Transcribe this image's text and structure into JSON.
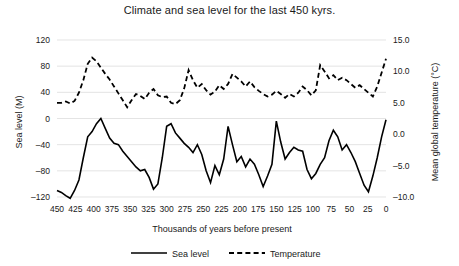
{
  "chart_data": {
    "type": "line",
    "title": "Climate and sea level for the last 450 kyrs.",
    "xlabel": "Thousands of years before present",
    "ylabel": "Sea level (M)",
    "y2label": "Mean global temperature (°C)",
    "grid": true,
    "legend_position": "bottom",
    "xlim": [
      450,
      0
    ],
    "x_inverted": true,
    "ylim": [
      -120,
      120
    ],
    "y2lim": [
      -10.0,
      15.0
    ],
    "xticks": [
      450,
      425,
      400,
      375,
      350,
      325,
      300,
      275,
      250,
      225,
      200,
      175,
      150,
      125,
      100,
      75,
      50,
      25,
      0
    ],
    "xtick_labels": [
      "450",
      "425",
      "400",
      "375",
      "350",
      "325",
      "300",
      "275",
      "250",
      "225",
      "200",
      "175",
      "150",
      "125",
      "100",
      "75",
      "50",
      "25",
      "0"
    ],
    "yticks": [
      120,
      80,
      40,
      0,
      -40,
      -80,
      -120
    ],
    "ytick_labels": [
      "120",
      "80",
      "40",
      "0",
      "–40",
      "–80",
      "–120"
    ],
    "y2ticks": [
      15.0,
      10.0,
      5.0,
      0.0,
      -5.0,
      -10.0
    ],
    "y2tick_labels": [
      "15.0",
      "10.0",
      "5.0",
      "0.0",
      "–5.0",
      "–10.0"
    ],
    "x": [
      450,
      444,
      438,
      432,
      426,
      420,
      414,
      408,
      402,
      396,
      390,
      384,
      378,
      372,
      366,
      360,
      354,
      348,
      342,
      336,
      330,
      324,
      318,
      312,
      306,
      300,
      294,
      288,
      282,
      276,
      270,
      264,
      258,
      252,
      246,
      240,
      234,
      228,
      222,
      216,
      210,
      204,
      198,
      192,
      186,
      180,
      174,
      168,
      162,
      156,
      150,
      144,
      138,
      132,
      126,
      120,
      114,
      108,
      102,
      96,
      90,
      84,
      78,
      72,
      66,
      60,
      54,
      48,
      42,
      36,
      30,
      24,
      18,
      12,
      6,
      0
    ],
    "series": [
      {
        "name": "Sea level",
        "axis": "left",
        "units": "M",
        "style": "solid",
        "color": "#000000",
        "values": [
          -110,
          -113,
          -118,
          -122,
          -110,
          -94,
          -60,
          -28,
          -20,
          -8,
          0,
          -15,
          -30,
          -38,
          -40,
          -50,
          -58,
          -66,
          -74,
          -80,
          -78,
          -90,
          -108,
          -100,
          -60,
          -12,
          -8,
          -22,
          -30,
          -38,
          -44,
          -52,
          -40,
          -55,
          -80,
          -98,
          -72,
          -86,
          -62,
          -12,
          -40,
          -66,
          -58,
          -74,
          -62,
          -70,
          -86,
          -104,
          -88,
          -70,
          -4,
          -36,
          -62,
          -52,
          -44,
          -48,
          -50,
          -78,
          -92,
          -84,
          -70,
          -60,
          -34,
          -18,
          -28,
          -48,
          -40,
          -52,
          -66,
          -84,
          -102,
          -112,
          -88,
          -60,
          -28,
          -2
        ]
      },
      {
        "name": "Temperature",
        "axis": "right",
        "units": "°C",
        "style": "dashed",
        "color": "#000000",
        "values": [
          5.0,
          5.0,
          5.2,
          4.9,
          5.3,
          6.6,
          8.6,
          11.2,
          12.2,
          11.6,
          10.6,
          9.6,
          8.7,
          7.6,
          6.5,
          5.4,
          4.3,
          5.4,
          6.4,
          6.1,
          5.6,
          6.6,
          7.2,
          6.2,
          5.9,
          6.0,
          5.0,
          4.8,
          5.4,
          7.3,
          10.2,
          8.6,
          7.4,
          8.0,
          7.0,
          6.3,
          6.8,
          7.8,
          7.2,
          8.0,
          9.6,
          9.0,
          8.4,
          7.6,
          8.4,
          7.5,
          6.9,
          6.4,
          6.0,
          6.3,
          6.9,
          6.4,
          5.8,
          6.4,
          6.0,
          6.6,
          7.6,
          7.0,
          6.2,
          7.0,
          11.0,
          10.0,
          8.9,
          9.4,
          8.6,
          9.0,
          8.6,
          8.0,
          7.4,
          7.8,
          7.2,
          6.6,
          6.0,
          7.6,
          9.8,
          12.0
        ]
      }
    ]
  }
}
